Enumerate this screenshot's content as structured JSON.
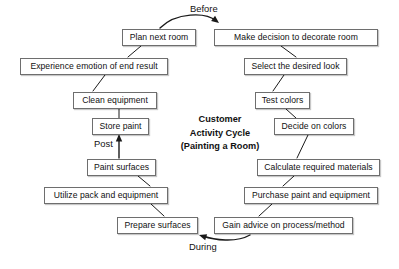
{
  "diagram": {
    "title_lines": [
      "Customer",
      "Activity Cycle",
      "(Painting a Room)"
    ],
    "background_color": "#ffffff",
    "node_border_color": "#6e6e6e",
    "node_fill_color": "#ffffff",
    "text_color": "#111111"
  },
  "phase_labels": [
    {
      "id": "before",
      "text": "Before",
      "x": 190,
      "y": 4
    },
    {
      "id": "post",
      "text": "Post",
      "x": 94,
      "y": 139
    },
    {
      "id": "during",
      "text": "During",
      "x": 189,
      "y": 242
    }
  ],
  "nodes": [
    {
      "id": "plan-next-room",
      "label": "Plan next room",
      "x": 122,
      "y": 29,
      "w": 74
    },
    {
      "id": "make-decision-to-decorate-room",
      "label": "Make decision to decorate room",
      "x": 214,
      "y": 29,
      "w": 164
    },
    {
      "id": "experience-emotion-of-end-result",
      "label": "Experience emotion of end result",
      "x": 20,
      "y": 58,
      "w": 148
    },
    {
      "id": "select-the-desired-look",
      "label": "Select the desired look",
      "x": 244,
      "y": 58,
      "w": 103
    },
    {
      "id": "clean-equipment",
      "label": "Clean equipment",
      "x": 73,
      "y": 92,
      "w": 84
    },
    {
      "id": "test-colors",
      "label": "Test colors",
      "x": 255,
      "y": 92,
      "w": 55
    },
    {
      "id": "store-paint",
      "label": "Store paint",
      "x": 92,
      "y": 118,
      "w": 57
    },
    {
      "id": "decide-on-colors",
      "label": "Decide on colors",
      "x": 274,
      "y": 118,
      "w": 80
    },
    {
      "id": "paint-surfaces",
      "label": "Paint surfaces",
      "x": 87,
      "y": 159,
      "w": 69
    },
    {
      "id": "calculate-required-materials",
      "label": "Calculate required materials",
      "x": 257,
      "y": 159,
      "w": 123
    },
    {
      "id": "utilize-pack-and-equipment",
      "label": "Utilize pack and equipment",
      "x": 44,
      "y": 187,
      "w": 124
    },
    {
      "id": "purchase-paint-and-equipment",
      "label": "Purchase paint and equipment",
      "x": 244,
      "y": 187,
      "w": 134
    },
    {
      "id": "prepare-surfaces",
      "label": "Prepare surfaces",
      "x": 117,
      "y": 217,
      "w": 81
    },
    {
      "id": "gain-advice-on-process-method",
      "label": "Gain advice on process/method",
      "x": 214,
      "y": 217,
      "w": 139
    }
  ],
  "edges": [
    {
      "id": "before-arc",
      "from": "plan-next-room",
      "to": "make-decision-to-decorate-room",
      "kind": "curve-arrow",
      "path": "M 160 28 C 176 12 206 12 216 21",
      "arrow": {
        "x": 219,
        "y": 23,
        "angle": 38
      }
    },
    {
      "id": "plan-to-experience",
      "from": "plan-next-room",
      "to": "experience-emotion-of-end-result",
      "kind": "line",
      "path": "M 141 46 L 128 57"
    },
    {
      "id": "make-decision-to-select",
      "from": "make-decision-to-decorate-room",
      "to": "select-the-desired-look",
      "kind": "line",
      "path": "M 281 46 L 296 57"
    },
    {
      "id": "experience-to-clean",
      "from": "experience-emotion-of-end-result",
      "to": "clean-equipment",
      "kind": "line",
      "path": "M 105 75 L 93 91"
    },
    {
      "id": "select-to-test",
      "from": "select-the-desired-look",
      "to": "test-colors",
      "kind": "line",
      "path": "M 284 75 L 273 91"
    },
    {
      "id": "clean-to-store",
      "from": "clean-equipment",
      "to": "store-paint",
      "kind": "line",
      "path": "M 119 109 L 119 118"
    },
    {
      "id": "test-to-decide",
      "from": "test-colors",
      "to": "decide-on-colors",
      "kind": "line",
      "path": "M 286 109 L 296 118"
    },
    {
      "id": "decide-to-calculate",
      "from": "decide-on-colors",
      "to": "calculate-required-materials",
      "kind": "line",
      "path": "M 308 135 L 297 158"
    },
    {
      "id": "paint-to-store-arrow",
      "from": "paint-surfaces",
      "to": "store-paint",
      "kind": "arrow",
      "path": "M 119 158 L 119 137",
      "arrow": {
        "x": 119,
        "y": 134,
        "angle": -90
      }
    },
    {
      "id": "calculate-to-purchase",
      "from": "calculate-required-materials",
      "to": "purchase-paint-and-equipment",
      "kind": "line",
      "path": "M 294 176 L 283 186"
    },
    {
      "id": "paint-to-utilize",
      "from": "paint-surfaces",
      "to": "utilize-pack-and-equipment",
      "kind": "line",
      "path": "M 138 176 L 150 186"
    },
    {
      "id": "utilize-to-prepare",
      "from": "utilize-pack-and-equipment",
      "to": "prepare-surfaces",
      "kind": "line",
      "path": "M 151 204 L 164 216"
    },
    {
      "id": "purchase-to-gain",
      "from": "purchase-paint-and-equipment",
      "to": "gain-advice-on-process-method",
      "kind": "line",
      "path": "M 272 204 L 259 216"
    },
    {
      "id": "during-arc",
      "from": "gain-advice-on-process-method",
      "to": "prepare-surfaces",
      "kind": "curve-arrow",
      "path": "M 250 235 C 236 243 214 240 203 236",
      "arrow": {
        "x": 199,
        "y": 235,
        "angle": 198
      }
    }
  ]
}
